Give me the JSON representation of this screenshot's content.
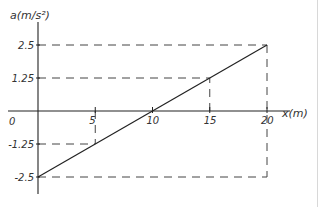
{
  "chart_data": {
    "type": "line",
    "title": "",
    "xlabel": "x(m)",
    "ylabel": "a(m/s²)",
    "x_ticks": [
      "0",
      "5",
      "10",
      "15",
      "20"
    ],
    "y_ticks": [
      "2.5",
      "1.25",
      "-1.25",
      "-2.5"
    ],
    "xlim": [
      0,
      20
    ],
    "ylim": [
      -2.5,
      2.5
    ],
    "grid": false,
    "legend": null,
    "series": [
      {
        "name": "a(x)",
        "x": [
          0,
          20
        ],
        "y": [
          -2.5,
          2.5
        ]
      }
    ],
    "reference_lines": [
      {
        "type": "dashed",
        "from": [
          0,
          2.5
        ],
        "to": [
          20,
          2.5
        ]
      },
      {
        "type": "dashed",
        "from": [
          0,
          1.25
        ],
        "to": [
          15,
          1.25
        ]
      },
      {
        "type": "dashed",
        "from": [
          0,
          -1.25
        ],
        "to": [
          5,
          -1.25
        ]
      },
      {
        "type": "dashed",
        "from": [
          0,
          -2.5
        ],
        "to": [
          20,
          -2.5
        ]
      },
      {
        "type": "dashed",
        "from": [
          5,
          0
        ],
        "to": [
          5,
          -1.25
        ]
      },
      {
        "type": "dashed",
        "from": [
          15,
          0
        ],
        "to": [
          15,
          1.25
        ]
      },
      {
        "type": "dashed",
        "from": [
          20,
          2.5
        ],
        "to": [
          20,
          -2.5
        ]
      }
    ],
    "style": {
      "line_color": "#222222",
      "dash_color": "#444444",
      "hand_drawn": true
    }
  },
  "labels": {
    "ylabel": "a(m/s²)",
    "xlabel": "x(m)",
    "origin": "0"
  }
}
